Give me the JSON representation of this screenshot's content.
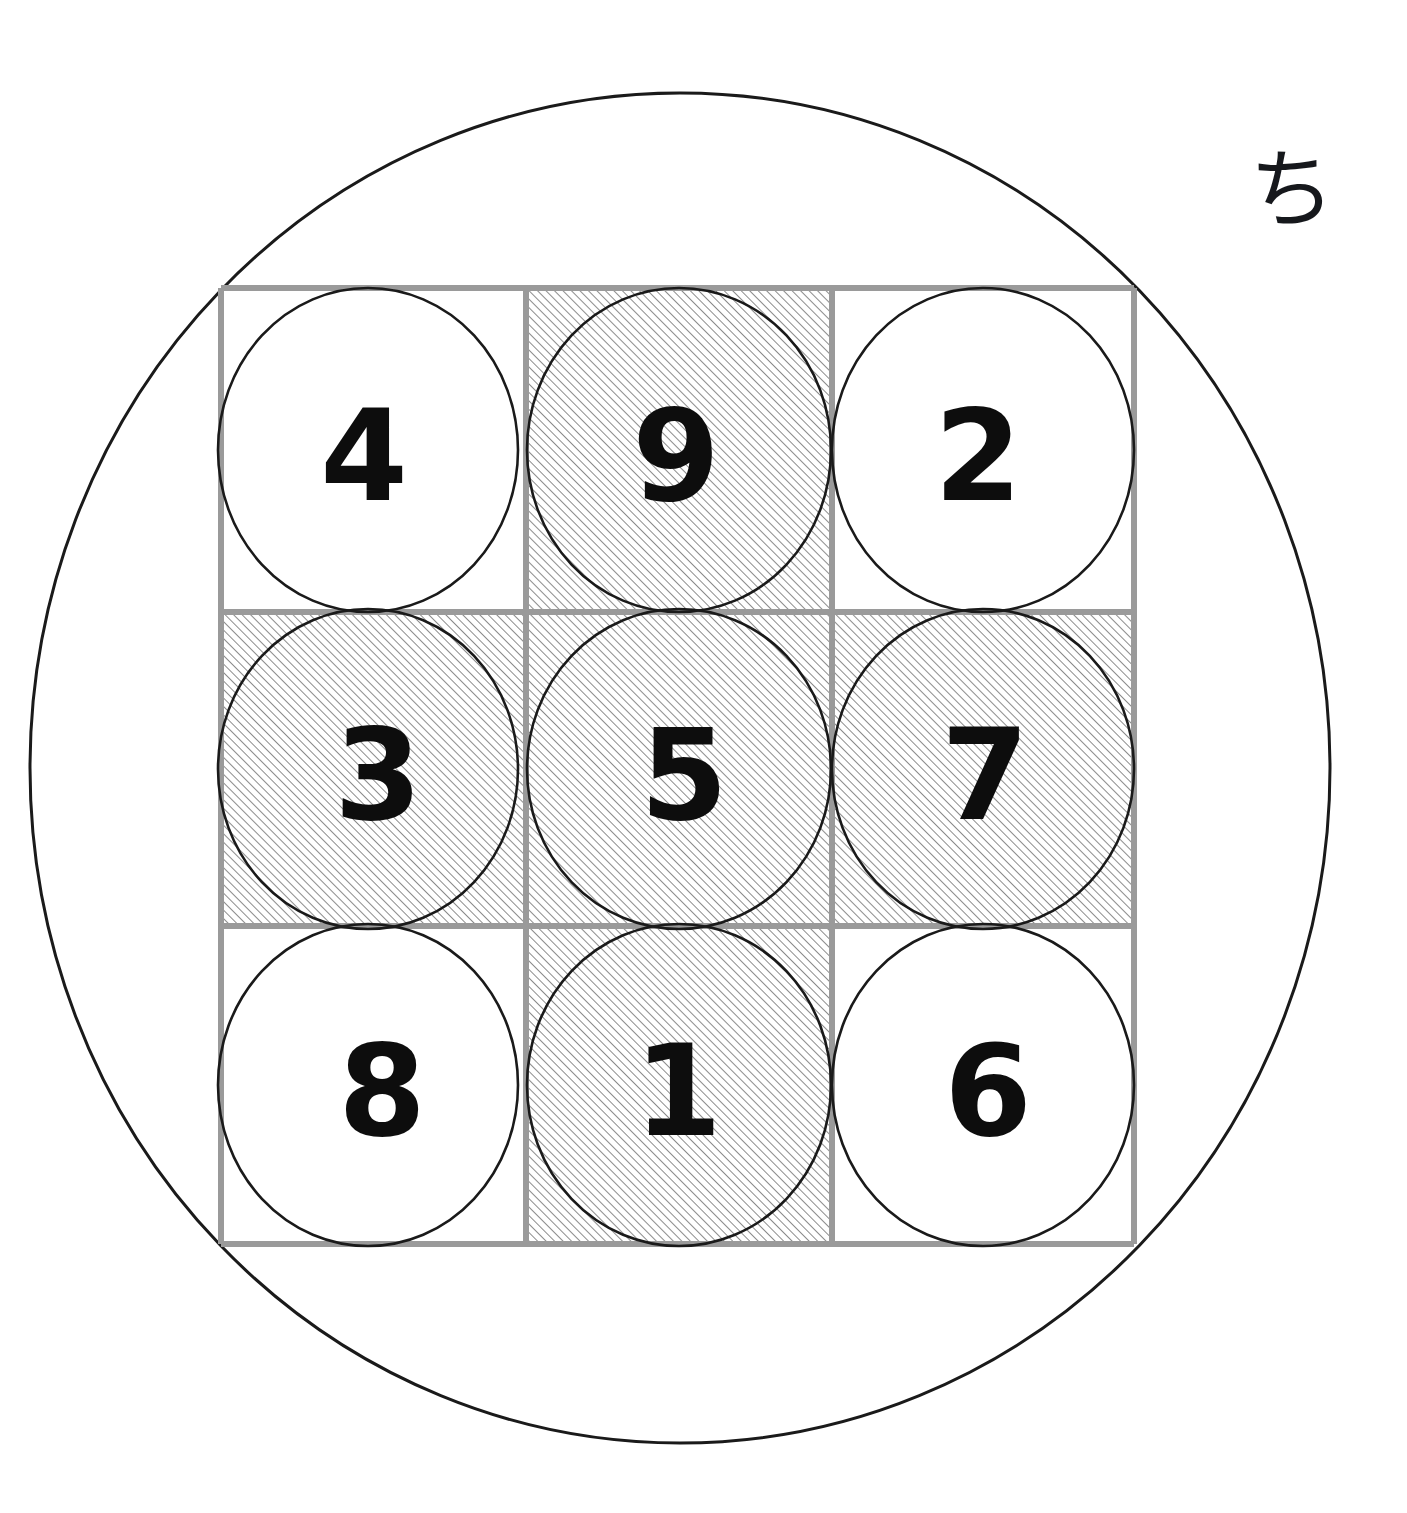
{
  "figure": {
    "kind": "diagram",
    "background_color": "#ffffff",
    "annotation_glyph": "ち",
    "annotation_glyph_name": "hiragana-chi",
    "annotation_glyph_color": "#16181c"
  },
  "outer_circle": {
    "name": "outer-ellipse",
    "cx": 680,
    "cy": 768,
    "rx": 650,
    "ry": 675,
    "stroke": "#1a1a1a",
    "stroke_width": 3,
    "fill": "none"
  },
  "grid": {
    "name": "three-by-three-grid",
    "x": 221,
    "y": 288,
    "width": 913,
    "height": 956,
    "columns": 3,
    "rows": 3,
    "line_color": "#9a9a9a",
    "line_width": 6,
    "col_edges": [
      221,
      526,
      832,
      1134
    ],
    "row_edges": [
      288,
      612,
      926,
      1244
    ]
  },
  "cells": [
    {
      "id": "r1c1",
      "row": 0,
      "col": 0,
      "value": "4",
      "hatched": false,
      "cell": {
        "x": 221,
        "y": 288,
        "w": 305,
        "h": 324
      },
      "circle": {
        "cx": 368,
        "cy": 450,
        "rx": 150,
        "ry": 162
      },
      "text": {
        "x": 364,
        "y": 456
      }
    },
    {
      "id": "r1c2",
      "row": 0,
      "col": 1,
      "value": "9",
      "hatched": true,
      "cell": {
        "x": 526,
        "y": 288,
        "w": 306,
        "h": 324
      },
      "circle": {
        "cx": 679,
        "cy": 450,
        "rx": 152,
        "ry": 162
      },
      "text": {
        "x": 676,
        "y": 456
      }
    },
    {
      "id": "r1c3",
      "row": 0,
      "col": 2,
      "value": "2",
      "hatched": false,
      "cell": {
        "x": 832,
        "y": 288,
        "w": 302,
        "h": 324
      },
      "circle": {
        "cx": 983,
        "cy": 450,
        "rx": 151,
        "ry": 162
      },
      "text": {
        "x": 978,
        "y": 456
      }
    },
    {
      "id": "r2c1",
      "row": 1,
      "col": 0,
      "value": "3",
      "hatched": true,
      "cell": {
        "x": 221,
        "y": 612,
        "w": 305,
        "h": 314
      },
      "circle": {
        "cx": 368,
        "cy": 769,
        "rx": 150,
        "ry": 160
      },
      "text": {
        "x": 378,
        "y": 775
      }
    },
    {
      "id": "r2c2",
      "row": 1,
      "col": 1,
      "value": "5",
      "hatched": true,
      "cell": {
        "x": 526,
        "y": 612,
        "w": 306,
        "h": 314
      },
      "circle": {
        "cx": 679,
        "cy": 769,
        "rx": 152,
        "ry": 160
      },
      "text": {
        "x": 684,
        "y": 775
      }
    },
    {
      "id": "r2c3",
      "row": 1,
      "col": 2,
      "value": "7",
      "hatched": true,
      "cell": {
        "x": 832,
        "y": 612,
        "w": 302,
        "h": 314
      },
      "circle": {
        "cx": 983,
        "cy": 769,
        "rx": 151,
        "ry": 160
      },
      "text": {
        "x": 985,
        "y": 775
      }
    },
    {
      "id": "r3c1",
      "row": 2,
      "col": 0,
      "value": "8",
      "hatched": false,
      "cell": {
        "x": 221,
        "y": 926,
        "w": 305,
        "h": 318
      },
      "circle": {
        "cx": 368,
        "cy": 1085,
        "rx": 150,
        "ry": 161
      },
      "text": {
        "x": 382,
        "y": 1091
      }
    },
    {
      "id": "r3c2",
      "row": 2,
      "col": 1,
      "value": "1",
      "hatched": true,
      "cell": {
        "x": 526,
        "y": 926,
        "w": 306,
        "h": 318
      },
      "circle": {
        "cx": 679,
        "cy": 1085,
        "rx": 152,
        "ry": 161
      },
      "text": {
        "x": 678,
        "y": 1091
      }
    },
    {
      "id": "r3c3",
      "row": 2,
      "col": 2,
      "value": "6",
      "hatched": false,
      "cell": {
        "x": 832,
        "y": 926,
        "w": 302,
        "h": 318
      },
      "circle": {
        "cx": 983,
        "cy": 1085,
        "rx": 151,
        "ry": 161
      },
      "text": {
        "x": 988,
        "y": 1091
      }
    }
  ],
  "style": {
    "digit_color": "#0d0d0d",
    "digit_font_size": 126,
    "digit_font_weight": 700,
    "circle_stroke": "#1a1a1a",
    "circle_stroke_width": 2.6,
    "circle_fill": "none",
    "hatch_line_color": "#6f6f6f",
    "hatch_line_width": 1.1,
    "hatch_spacing": 6,
    "hatch_angle_deg": 45,
    "hatch_direction": "bottom-left-to-top-right"
  }
}
